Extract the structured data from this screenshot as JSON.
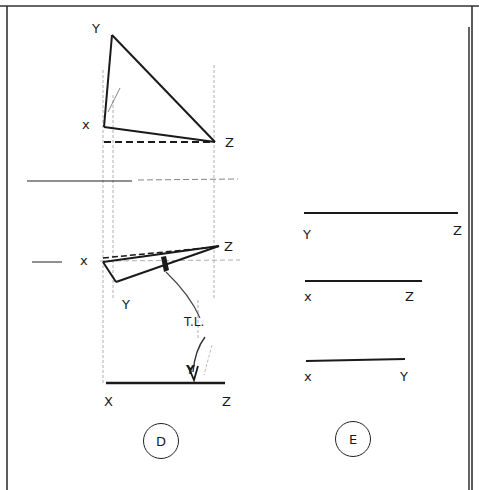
{
  "figure": {
    "colors": {
      "ink": "#1a1a1a",
      "construction": "#9a9a9a",
      "paper": "#ffffff"
    }
  },
  "view_d": {
    "top_view_labels": {
      "y": "Y",
      "x": "x",
      "z": "Z"
    },
    "front_view_labels": {
      "x": "x",
      "z": "Z",
      "y": "Y"
    },
    "true_length_labels": {
      "t": "T.L.",
      "y": "Y"
    },
    "baseline_labels": {
      "x": "X",
      "z": "Z"
    },
    "circle_label": "D"
  },
  "view_e": {
    "lines": [
      {
        "start": "Y",
        "end": "Z"
      },
      {
        "start": "x",
        "end": "Z"
      },
      {
        "start": "x",
        "end": "Y"
      }
    ],
    "circle_label": "E"
  }
}
